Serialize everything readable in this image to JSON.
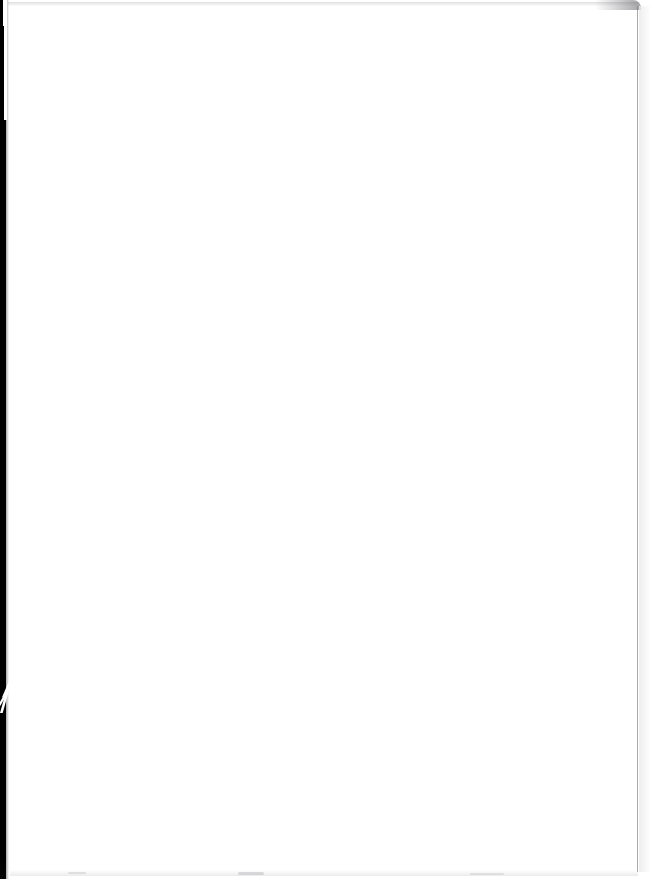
{
  "page": {
    "kind": "scanned-document-page",
    "content_text": "",
    "blank_note": "This page is blank.",
    "width_px": 651,
    "height_px": 879
  },
  "colors": {
    "paper": "#ffffff",
    "gutter_black": "#000000",
    "edge_rule_gray": "#787880",
    "smudge_gray": "#a0a0a6"
  },
  "artifacts": {
    "left_gutter": {
      "name": "left-gutter-strip",
      "color": "#000000",
      "width_px": 6
    },
    "gutter_curl": {
      "name": "page-curl-notch",
      "top_px": 681,
      "height_px": 32
    },
    "top_band": {
      "name": "top-scan-band",
      "top_px": 2,
      "height_px": 4
    },
    "right_rule": {
      "name": "right-edge-rule",
      "left_px": 637,
      "height_px": 866
    },
    "bottom_smudge": {
      "name": "bottom-smudge-band",
      "height_px": 6
    }
  }
}
